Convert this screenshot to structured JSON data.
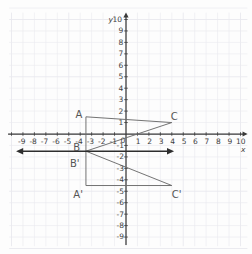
{
  "figure": {
    "background_color": "#fdfdfd",
    "grid_color": "#e9e9ee",
    "axis_color": "#3a3a3a",
    "shape_color": "#6b6b6b",
    "mirror_line_color": "#2e2e2e",
    "label_color": "#4a4a4a"
  },
  "axes": {
    "x_label": "x",
    "y_label": "y",
    "origin_label": "0",
    "x_ticks_negative": [
      "-9",
      "-8",
      "-7",
      "-6",
      "-5",
      "-4",
      "-3",
      "-2",
      "-1"
    ],
    "x_ticks_positive": [
      "1",
      "2",
      "3",
      "4",
      "5",
      "6",
      "7",
      "8",
      "9",
      "10"
    ],
    "y_ticks_positive": [
      "10",
      "9",
      "8",
      "7",
      "6",
      "5",
      "4",
      "3",
      "2",
      "1"
    ],
    "y_ticks_negative": [
      "-1",
      "-2",
      "-3",
      "-4",
      "-5",
      "-6",
      "-7",
      "-8",
      "-9"
    ],
    "xlim": [
      -10,
      10.6
    ],
    "ylim": [
      -9.8,
      10.6
    ]
  },
  "chart_data": {
    "type": "scatter",
    "xlabel": "x",
    "ylabel": "y",
    "xlim": [
      -10,
      10.6
    ],
    "ylim": [
      -9.8,
      10.6
    ],
    "grid": true,
    "legend": "none",
    "series": [
      {
        "name": "Triangle ABC (pre-image)",
        "type": "polygon",
        "points": [
          {
            "label": "A",
            "x": -3.5,
            "y": 1.5
          },
          {
            "label": "C",
            "x": 4.0,
            "y": 1.0
          },
          {
            "label": "B",
            "x": -3.5,
            "y": -1.5
          }
        ]
      },
      {
        "name": "Triangle A'B'C' (image)",
        "type": "polygon",
        "points": [
          {
            "label": "B'",
            "x": -3.5,
            "y": -1.5
          },
          {
            "label": "C'",
            "x": 4.0,
            "y": -4.5
          },
          {
            "label": "A'",
            "x": -3.5,
            "y": -4.5
          }
        ]
      },
      {
        "name": "Line of reflection",
        "type": "line",
        "y": -1.5,
        "double_arrow": true,
        "x_start": -9.6,
        "x_end": 4.2
      }
    ],
    "vertex_labels": [
      {
        "text": "A",
        "x": -4.4,
        "y": 2.1
      },
      {
        "text": "C",
        "x": 3.9,
        "y": 1.9
      },
      {
        "text": "B",
        "x": -4.6,
        "y": -0.75
      },
      {
        "text": "B'",
        "x": -4.9,
        "y": -2.2
      },
      {
        "text": "A'",
        "x": -4.6,
        "y": -4.9
      },
      {
        "text": "C'",
        "x": 4.0,
        "y": -4.9
      }
    ]
  }
}
